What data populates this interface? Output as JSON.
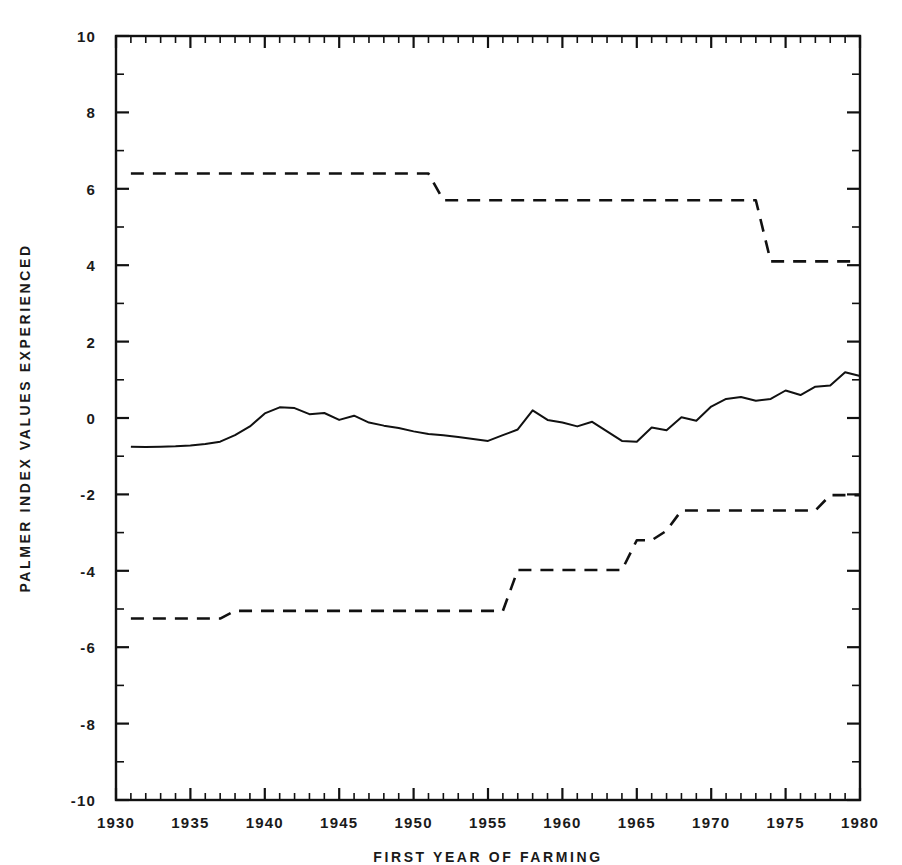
{
  "chart_data": {
    "type": "line",
    "title": "",
    "xlabel": "FIRST YEAR OF FARMING",
    "ylabel": "PALMER INDEX VALUES EXPERIENCED",
    "xlim": [
      1930,
      1980
    ],
    "ylim": [
      -10,
      10
    ],
    "xticks": [
      1930,
      1935,
      1940,
      1945,
      1950,
      1955,
      1960,
      1965,
      1970,
      1975,
      1980
    ],
    "xtick_labels": [
      "1930",
      "1935",
      "1940",
      "1945",
      "1950",
      "1955",
      "1960",
      "1965",
      "1970",
      "1975",
      "1980"
    ],
    "x_minor_tick_step": 1,
    "yticks": [
      -10,
      -8,
      -6,
      -4,
      -2,
      0,
      2,
      4,
      6,
      8,
      10
    ],
    "ytick_labels": [
      "-10",
      "-8",
      "-6",
      "-4",
      "-2",
      "0",
      "2",
      "4",
      "6",
      "8",
      "10"
    ],
    "y_minor_tick_step": 1,
    "grid": false,
    "legend": "none",
    "line_color": "#111111",
    "x": [
      1931,
      1932,
      1933,
      1934,
      1935,
      1936,
      1937,
      1938,
      1939,
      1940,
      1941,
      1942,
      1943,
      1944,
      1945,
      1946,
      1947,
      1948,
      1949,
      1950,
      1951,
      1952,
      1953,
      1954,
      1955,
      1956,
      1957,
      1958,
      1959,
      1960,
      1961,
      1962,
      1963,
      1964,
      1965,
      1966,
      1967,
      1968,
      1969,
      1970,
      1971,
      1972,
      1973,
      1974,
      1975,
      1976,
      1977,
      1978,
      1979,
      1980
    ],
    "series": [
      {
        "name": "maximum Palmer index experienced",
        "style": "dashed",
        "values": [
          6.4,
          6.4,
          6.4,
          6.4,
          6.4,
          6.4,
          6.4,
          6.4,
          6.4,
          6.4,
          6.4,
          6.4,
          6.4,
          6.4,
          6.4,
          6.4,
          6.4,
          6.4,
          6.4,
          6.4,
          6.4,
          5.7,
          5.7,
          5.7,
          5.7,
          5.7,
          5.7,
          5.7,
          5.7,
          5.7,
          5.7,
          5.7,
          5.7,
          5.7,
          5.7,
          5.7,
          5.7,
          5.7,
          5.7,
          5.7,
          5.7,
          5.7,
          5.7,
          4.1,
          4.1,
          4.1,
          4.1,
          4.1,
          4.1,
          4.1
        ]
      },
      {
        "name": "mean Palmer index experienced",
        "style": "solid",
        "values": [
          -0.75,
          -0.76,
          -0.75,
          -0.74,
          -0.72,
          -0.68,
          -0.62,
          -0.45,
          -0.22,
          0.12,
          0.28,
          0.26,
          0.1,
          0.13,
          -0.05,
          0.06,
          -0.12,
          -0.2,
          -0.26,
          -0.35,
          -0.42,
          -0.45,
          -0.5,
          -0.55,
          -0.6,
          -0.45,
          -0.3,
          0.2,
          -0.05,
          -0.12,
          -0.22,
          -0.1,
          -0.35,
          -0.6,
          -0.62,
          -0.25,
          -0.32,
          0.02,
          -0.07,
          0.3,
          0.5,
          0.55,
          0.45,
          0.5,
          0.72,
          0.6,
          0.82,
          0.85,
          1.2,
          1.1
        ]
      },
      {
        "name": "minimum Palmer index experienced",
        "style": "dashed",
        "values": [
          -5.25,
          -5.25,
          -5.25,
          -5.25,
          -5.25,
          -5.25,
          -5.25,
          -5.05,
          -5.05,
          -5.05,
          -5.05,
          -5.05,
          -5.05,
          -5.05,
          -5.05,
          -5.05,
          -5.05,
          -5.05,
          -5.05,
          -5.05,
          -5.05,
          -5.05,
          -5.05,
          -5.05,
          -5.05,
          -5.05,
          -3.98,
          -3.98,
          -3.98,
          -3.98,
          -3.98,
          -3.98,
          -3.98,
          -3.98,
          -3.2,
          -3.2,
          -2.95,
          -2.42,
          -2.42,
          -2.42,
          -2.42,
          -2.42,
          -2.42,
          -2.42,
          -2.42,
          -2.42,
          -2.42,
          -2.02,
          -2.02,
          -2.02
        ]
      }
    ]
  }
}
